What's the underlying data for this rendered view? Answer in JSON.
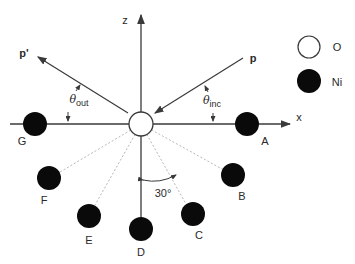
{
  "diagram": {
    "axes": {
      "x_label": "x",
      "z_label": "z"
    },
    "vectors": {
      "incident_label": "p",
      "outgoing_label": "p'"
    },
    "angles": {
      "theta_symbol": "θ",
      "inc_subscript": "inc",
      "out_subscript": "out",
      "sector_angle": "30°"
    },
    "legend": {
      "items": [
        {
          "symbol": "open-circle",
          "label": "O"
        },
        {
          "symbol": "filled-circle",
          "label": "Ni"
        }
      ]
    },
    "atoms": {
      "center": {
        "label": "O",
        "x": 141,
        "y": 124
      },
      "neighbors": [
        {
          "label": "A",
          "x": 247,
          "y": 124
        },
        {
          "label": "B",
          "x": 233,
          "y": 175
        },
        {
          "label": "C",
          "x": 193,
          "y": 214
        },
        {
          "label": "D",
          "x": 141,
          "y": 229
        },
        {
          "label": "E",
          "x": 89,
          "y": 216
        },
        {
          "label": "F",
          "x": 49,
          "y": 178
        },
        {
          "label": "G",
          "x": 35,
          "y": 124
        }
      ]
    },
    "colors": {
      "line": "#3a3a3a",
      "dotted": "#b0b0b0",
      "atom_fill": "#0a0a0a"
    }
  }
}
